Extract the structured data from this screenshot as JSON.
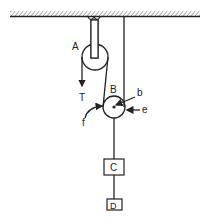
{
  "diagram": {
    "type": "pulley-system",
    "labels": {
      "pulley_a": "A",
      "pulley_b": "B",
      "tension": "T",
      "block_c": "C",
      "block_d": "D",
      "arrow_b": "b",
      "arrow_e": "e",
      "arrow_f": "f"
    },
    "colors": {
      "stroke": "#222222",
      "background": "#ffffff"
    }
  }
}
